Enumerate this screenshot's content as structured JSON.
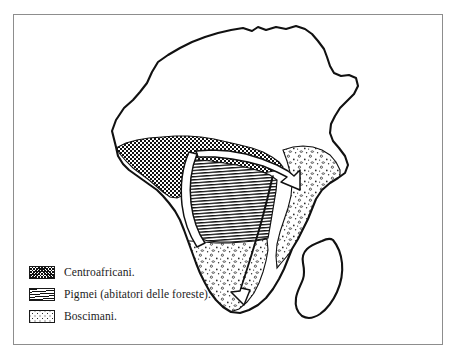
{
  "figure": {
    "kind": "ethnographic-map",
    "region": "Africa",
    "background_color": "#ffffff",
    "ink_color": "#111111",
    "frame_color": "#8d8d8d"
  },
  "legend": {
    "items": [
      {
        "swatch": "dense-checker-stipple",
        "swatch_style": "sw-centro",
        "label": "Centroafricani.",
        "color": "#111111"
      },
      {
        "swatch": "horizontal-hatch",
        "swatch_style": "sw-pigmei",
        "label": "Pigmei (abitatori delle foreste).",
        "color": "#111111"
      },
      {
        "swatch": "sparse-dot-stipple",
        "swatch_style": "sw-bosci",
        "label": "Boscimani.",
        "color": "#111111"
      }
    ]
  },
  "map": {
    "landmasses": [
      {
        "name": "africa-mainland",
        "filled": false
      },
      {
        "name": "madagascar",
        "filled": false
      }
    ],
    "regions": [
      {
        "name": "centroafricani-region",
        "pattern": "dense-checker-stipple",
        "description": "Band across West Africa / Sudan belt"
      },
      {
        "name": "pigmei-region",
        "pattern": "horizontal-hatch",
        "description": "Congo basin forest block"
      },
      {
        "name": "boscimani-region",
        "pattern": "sparse-dot-stipple",
        "description": "Southern Africa and East African corridor"
      }
    ],
    "migration_arrows": [
      {
        "name": "arrow-east",
        "direction": "east",
        "head": "right"
      },
      {
        "name": "arrow-south",
        "direction": "south",
        "head": "down"
      },
      {
        "name": "arrow-west-congo",
        "direction": "south-west",
        "head": "none"
      }
    ]
  }
}
